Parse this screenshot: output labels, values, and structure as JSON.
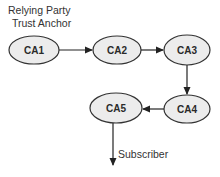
{
  "diagram": {
    "labels": {
      "relying_party": "Relying Party",
      "trust_anchor": "Trust Anchor",
      "subscriber": "Subscriber"
    },
    "nodes": [
      {
        "id": "CA1",
        "label": "CA1",
        "cx": 34,
        "cy": 50,
        "rx": 25,
        "ry": 14
      },
      {
        "id": "CA2",
        "label": "CA2",
        "cx": 117,
        "cy": 50,
        "rx": 24,
        "ry": 14
      },
      {
        "id": "CA3",
        "label": "CA3",
        "cx": 187,
        "cy": 50,
        "rx": 23,
        "ry": 15
      },
      {
        "id": "CA4",
        "label": "CA4",
        "cx": 187,
        "cy": 109,
        "rx": 23,
        "ry": 14
      },
      {
        "id": "CA5",
        "label": "CA5",
        "cx": 116,
        "cy": 108,
        "rx": 26,
        "ry": 15
      }
    ],
    "edges": [
      {
        "from": "CA1",
        "to": "CA2"
      },
      {
        "from": "CA2",
        "to": "CA3"
      },
      {
        "from": "CA3",
        "to": "CA4"
      },
      {
        "from": "CA4",
        "to": "CA5"
      },
      {
        "from": "CA5",
        "to": "Subscriber"
      }
    ],
    "colors": {
      "node_fill": "#ececec",
      "node_stroke": "#333333",
      "edge": "#222222",
      "text": "#2a2a2a"
    }
  }
}
